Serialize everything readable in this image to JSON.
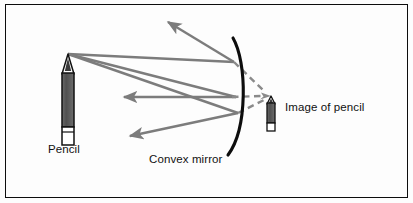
{
  "figure": {
    "kind": "optics-ray-diagram",
    "title_visible": false,
    "background_color": "#fdfdfd",
    "border_color": "#0d0d0d",
    "ray_color": "#7c7c7c",
    "mirror_color": "#0d0d0d",
    "pencil_body_color": "#5e5e5e",
    "pencil_outline_color": "#111111"
  },
  "labels": {
    "pencil": "Pencil",
    "image_of_pencil": "Image of pencil",
    "convex_mirror": "Convex mirror"
  },
  "objects": {
    "pencil": {
      "name": "Pencil",
      "tip_x": 68,
      "tip_y": 54,
      "bottom_x": 68,
      "bottom_y": 146,
      "width": 12
    },
    "image_pencil": {
      "name": "Image of pencil",
      "tip_x": 271,
      "tip_y": 96,
      "bottom_x": 271,
      "bottom_y": 131,
      "width": 8
    },
    "mirror": {
      "name": "Convex mirror",
      "top_x": 233,
      "top_y": 38,
      "mid_x": 243,
      "mid_y": 97,
      "bottom_x": 228,
      "bottom_y": 155,
      "curvature": "convex-toward-object"
    }
  },
  "rays": {
    "incident": [
      {
        "from": [
          68,
          54
        ],
        "to": [
          234,
          62
        ],
        "style": "solid"
      },
      {
        "from": [
          68,
          54
        ],
        "to": [
          236,
          97
        ],
        "style": "solid"
      },
      {
        "from": [
          68,
          54
        ],
        "to": [
          238,
          113
        ],
        "style": "solid"
      }
    ],
    "reflected": [
      {
        "from": [
          234,
          62
        ],
        "to": [
          163,
          18
        ],
        "style": "solid",
        "arrow": true
      },
      {
        "from": [
          236,
          97
        ],
        "to": [
          118,
          97
        ],
        "style": "solid",
        "arrow": true
      },
      {
        "from": [
          238,
          113
        ],
        "to": [
          124,
          138
        ],
        "style": "solid",
        "arrow": true
      }
    ],
    "virtual": [
      {
        "from": [
          234,
          62
        ],
        "to": [
          271,
          96
        ],
        "style": "dashed",
        "arrow": true
      },
      {
        "from": [
          236,
          97
        ],
        "to": [
          271,
          96
        ],
        "style": "dashed",
        "arrow": true
      },
      {
        "from": [
          238,
          113
        ],
        "to": [
          271,
          96
        ],
        "style": "dashed",
        "arrow": true
      }
    ]
  }
}
